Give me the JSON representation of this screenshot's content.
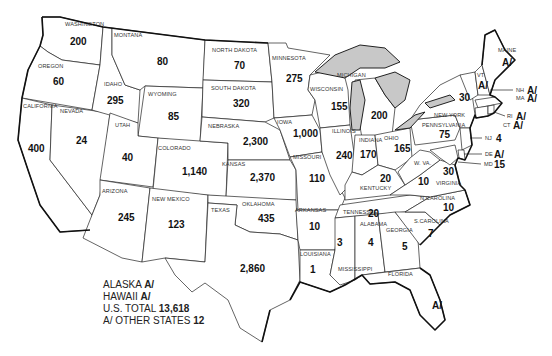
{
  "map": {
    "title": "",
    "states": [
      {
        "name": "WASHINGTON",
        "value": "200"
      },
      {
        "name": "OREGON",
        "value": "60"
      },
      {
        "name": "CALIFORNIA",
        "value": "400"
      },
      {
        "name": "NEVADA",
        "value": "24"
      },
      {
        "name": "IDAHO",
        "value": "295"
      },
      {
        "name": "MONTANA",
        "value": "80"
      },
      {
        "name": "WYOMING",
        "value": "85"
      },
      {
        "name": "UTAH",
        "value": "40"
      },
      {
        "name": "COLORADO",
        "value": "1,140"
      },
      {
        "name": "ARIZONA",
        "value": "245"
      },
      {
        "name": "NEW MEXICO",
        "value": "123"
      },
      {
        "name": "NORTH DAKOTA",
        "value": "70"
      },
      {
        "name": "SOUTH DAKOTA",
        "value": "320"
      },
      {
        "name": "NEBRASKA",
        "value": "2,300"
      },
      {
        "name": "KANSAS",
        "value": "2,370"
      },
      {
        "name": "OKLAHOMA",
        "value": "435"
      },
      {
        "name": "TEXAS",
        "value": "2,860"
      },
      {
        "name": "MINNESOTA",
        "value": "275"
      },
      {
        "name": "IOWA",
        "value": "1,000"
      },
      {
        "name": "MISSOURI",
        "value": "110"
      },
      {
        "name": "ARKANSAS",
        "value": "10"
      },
      {
        "name": "LOUISIANA",
        "value": "1"
      },
      {
        "name": "WISCONSIN",
        "value": "155"
      },
      {
        "name": "ILLINOIS",
        "value": "240"
      },
      {
        "name": "MICHIGAN",
        "value": "200"
      },
      {
        "name": "INDIANA",
        "value": "170"
      },
      {
        "name": "OHIO",
        "value": "165"
      },
      {
        "name": "KENTUCKY",
        "value": "20"
      },
      {
        "name": "TENNESSEE",
        "value": "20"
      },
      {
        "name": "MISSISSIPPI",
        "value": "3"
      },
      {
        "name": "ALABAMA",
        "value": "4"
      },
      {
        "name": "GEORGIA",
        "value": "5"
      },
      {
        "name": "FLORIDA",
        "value": "A/"
      },
      {
        "name": "S.CAROLINA",
        "value": "7"
      },
      {
        "name": "N.CAROLINA",
        "value": "10"
      },
      {
        "name": "VIRGINIA",
        "value": "30"
      },
      {
        "name": "W. VA.",
        "value": "10"
      },
      {
        "name": "PENNSYLVANIA",
        "value": "75"
      },
      {
        "name": "NEW YORK",
        "value": "30"
      },
      {
        "name": "VT",
        "value": "A/"
      },
      {
        "name": "MAINE",
        "value": "A/"
      },
      {
        "name": "NH",
        "value": "A/"
      },
      {
        "name": "MA",
        "value": "A/"
      },
      {
        "name": "RI",
        "value": "A/"
      },
      {
        "name": "CT",
        "value": "A/"
      },
      {
        "name": "NJ",
        "value": "4"
      },
      {
        "name": "DE",
        "value": "A/"
      },
      {
        "name": "MD",
        "value": "15"
      }
    ]
  },
  "legend": {
    "alaska_label": "ALASKA",
    "alaska_value": "A/",
    "hawaii_label": "HAWAII",
    "hawaii_value": "A/",
    "total_label": "U.S. TOTAL",
    "total_value": "13,618",
    "other_label": "A/ OTHER STATES",
    "other_value": "12"
  }
}
